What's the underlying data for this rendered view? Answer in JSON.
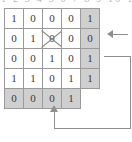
{
  "figure": {
    "type": "binary-matrix-with-parity-and-feedback",
    "top_cutoff_text": "1 2 3 4 5 6 7 8 9 10 11 12",
    "colors": {
      "shaded_cell": "#cfcfcf",
      "cell_border": "#9a9a9a",
      "wire": "#8f8f8f",
      "text": "#3a3a3a"
    }
  },
  "matrix": {
    "rows": [
      {
        "name": "data-row-1",
        "cells": [
          {
            "value": "1",
            "shaded": false,
            "crossed": false
          },
          {
            "value": "0",
            "shaded": false,
            "crossed": false
          },
          {
            "value": "0",
            "shaded": false,
            "crossed": false
          },
          {
            "value": "0",
            "shaded": false,
            "crossed": false
          },
          {
            "value": "1",
            "shaded": true,
            "crossed": false
          }
        ]
      },
      {
        "name": "data-row-2",
        "cells": [
          {
            "value": "0",
            "shaded": false,
            "crossed": false
          },
          {
            "value": "1",
            "shaded": false,
            "crossed": false
          },
          {
            "value": "0",
            "shaded": false,
            "crossed": true
          },
          {
            "value": "0",
            "shaded": false,
            "crossed": false
          },
          {
            "value": "0",
            "shaded": true,
            "crossed": false
          }
        ]
      },
      {
        "name": "data-row-3",
        "cells": [
          {
            "value": "0",
            "shaded": false,
            "crossed": false
          },
          {
            "value": "0",
            "shaded": false,
            "crossed": false
          },
          {
            "value": "1",
            "shaded": false,
            "crossed": false
          },
          {
            "value": "0",
            "shaded": false,
            "crossed": false
          },
          {
            "value": "1",
            "shaded": true,
            "crossed": false
          }
        ]
      },
      {
        "name": "data-row-4",
        "cells": [
          {
            "value": "1",
            "shaded": false,
            "crossed": false
          },
          {
            "value": "1",
            "shaded": false,
            "crossed": false
          },
          {
            "value": "0",
            "shaded": false,
            "crossed": false
          },
          {
            "value": "1",
            "shaded": false,
            "crossed": false
          },
          {
            "value": "1",
            "shaded": true,
            "crossed": false
          }
        ]
      },
      {
        "name": "parity-row",
        "cells": [
          {
            "value": "0",
            "shaded": true,
            "crossed": false
          },
          {
            "value": "0",
            "shaded": true,
            "crossed": false
          },
          {
            "value": "0",
            "shaded": true,
            "crossed": false
          },
          {
            "value": "1",
            "shaded": true,
            "crossed": false
          },
          {
            "value": "",
            "shaded": false,
            "crossed": false,
            "empty": true
          }
        ]
      }
    ]
  },
  "annotations": {
    "row_arrow": {
      "name": "row-in-arrow",
      "direction": "left",
      "target_row": 2
    },
    "feedback_loop": {
      "name": "feedback-loop",
      "target_column": 3,
      "direction": "up"
    }
  }
}
